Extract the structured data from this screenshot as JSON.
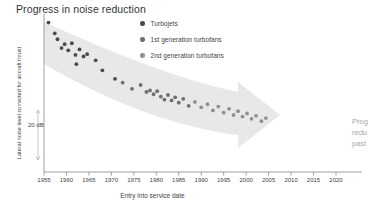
{
  "chart_data": {
    "type": "scatter",
    "title": "Progress in noise reduction",
    "xlabel": "Entry into service date",
    "ylabel": "Lateral noise level corrected for aircraft thrust",
    "xlim": [
      1955,
      2020
    ],
    "ylim": [
      0,
      100
    ],
    "grid": false,
    "legend_position": "top-center",
    "xticks": [
      "1955",
      "1960",
      "1965",
      "1970",
      "1975",
      "1980",
      "1985",
      "1990",
      "1995",
      "2000",
      "2005",
      "2010",
      "2015",
      "2020"
    ],
    "xtick_values": [
      1955,
      1960,
      1965,
      1970,
      1975,
      1980,
      1985,
      1990,
      1995,
      2000,
      2005,
      2010,
      2015,
      2020
    ],
    "yticks": [],
    "scale_bar": {
      "label": "20 dB",
      "value": 20,
      "units": "dB",
      "y_top": 110,
      "y_bottom": 160
    },
    "annotations": [
      {
        "text": "Progress in noise reduction",
        "kind": "title"
      },
      {
        "text": "20 dB",
        "kind": "scale-bar-label"
      }
    ],
    "trend_arrow": {
      "label": "declining trend",
      "direction": "right-downward",
      "color": "#e8e8e8"
    },
    "series": [
      {
        "name": "Turbojets",
        "color": "#4a4a4a",
        "marker": "circle",
        "points": [
          {
            "x": 1956.0,
            "y": 97.0
          },
          {
            "x": 1957.4,
            "y": 90.0
          },
          {
            "x": 1958.0,
            "y": 86.2
          },
          {
            "x": 1958.9,
            "y": 80.5
          },
          {
            "x": 1959.6,
            "y": 83.0
          },
          {
            "x": 1960.4,
            "y": 79.0
          },
          {
            "x": 1961.2,
            "y": 83.6
          },
          {
            "x": 1962.0,
            "y": 76.0
          },
          {
            "x": 1962.9,
            "y": 79.6
          },
          {
            "x": 1963.8,
            "y": 75.0
          },
          {
            "x": 1964.6,
            "y": 76.5
          },
          {
            "x": 1962.2,
            "y": 70.0
          },
          {
            "x": 1966.5,
            "y": 72.5
          },
          {
            "x": 1968.0,
            "y": 66.0
          },
          {
            "x": 1970.8,
            "y": 60.5
          }
        ]
      },
      {
        "name": "1st generation turbofans",
        "color": "#6e6e6e",
        "marker": "circle",
        "points": [
          {
            "x": 1972.5,
            "y": 58.0
          },
          {
            "x": 1974.6,
            "y": 54.0
          },
          {
            "x": 1976.5,
            "y": 56.5
          },
          {
            "x": 1977.8,
            "y": 52.0
          },
          {
            "x": 1978.6,
            "y": 53.0
          },
          {
            "x": 1979.4,
            "y": 50.5
          },
          {
            "x": 1980.2,
            "y": 52.5
          },
          {
            "x": 1981.0,
            "y": 49.0
          },
          {
            "x": 1981.8,
            "y": 47.0
          },
          {
            "x": 1982.6,
            "y": 50.0
          },
          {
            "x": 1983.4,
            "y": 46.5
          },
          {
            "x": 1984.2,
            "y": 48.5
          },
          {
            "x": 1985.0,
            "y": 45.0
          },
          {
            "x": 1986.0,
            "y": 47.5
          },
          {
            "x": 1987.2,
            "y": 43.0
          }
        ]
      },
      {
        "name": "2nd generation turbofans",
        "color": "#909090",
        "marker": "circle",
        "points": [
          {
            "x": 1988.6,
            "y": 45.5
          },
          {
            "x": 1990.0,
            "y": 42.0
          },
          {
            "x": 1991.4,
            "y": 44.0
          },
          {
            "x": 1992.6,
            "y": 40.0
          },
          {
            "x": 1993.8,
            "y": 42.5
          },
          {
            "x": 1995.0,
            "y": 38.5
          },
          {
            "x": 1996.2,
            "y": 41.0
          },
          {
            "x": 1997.2,
            "y": 37.0
          },
          {
            "x": 1998.2,
            "y": 39.5
          },
          {
            "x": 1999.2,
            "y": 36.0
          },
          {
            "x": 2000.2,
            "y": 38.0
          },
          {
            "x": 2001.2,
            "y": 34.5
          },
          {
            "x": 2002.2,
            "y": 36.5
          },
          {
            "x": 2003.4,
            "y": 33.0
          },
          {
            "x": 2004.4,
            "y": 35.0
          }
        ]
      }
    ]
  },
  "side_note": {
    "line1": "Prog",
    "line2": "redu",
    "line3": "past"
  }
}
